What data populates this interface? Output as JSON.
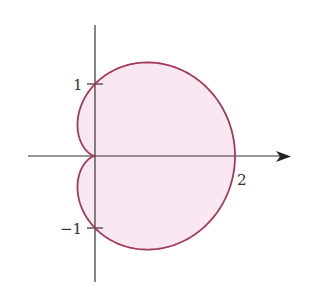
{
  "chart_data": {
    "type": "line",
    "title": "",
    "subtitle": "",
    "xlabel": "",
    "ylabel": "",
    "curve": "r = 1 + cos(theta)",
    "theta_range": [
      0,
      6.283185
    ],
    "series": [
      {
        "name": "cardioid",
        "stroke": "#a33a5a",
        "fill": "#f9e8f1",
        "points": [
          [
            2.0,
            0.0
          ],
          [
            1.866,
            0.5
          ],
          [
            1.5,
            0.866
          ],
          [
            1.0,
            1.0
          ],
          [
            0.75,
            1.299
          ],
          [
            0.0,
            1.0
          ],
          [
            -0.25,
            0.433
          ],
          [
            0.0,
            0.0
          ],
          [
            -0.25,
            -0.433
          ],
          [
            0.0,
            -1.0
          ],
          [
            0.75,
            -1.299
          ],
          [
            1.0,
            -1.0
          ],
          [
            1.5,
            -0.866
          ],
          [
            1.866,
            -0.5
          ],
          [
            2.0,
            0.0
          ]
        ]
      }
    ],
    "x_ticks": [
      {
        "value": 2,
        "label": "2"
      }
    ],
    "y_ticks": [
      {
        "value": 1,
        "label": "1"
      },
      {
        "value": -1,
        "label": "−1"
      }
    ],
    "xlim": [
      -0.95,
      2.8
    ],
    "ylim": [
      -1.75,
      1.8
    ],
    "grid": false,
    "legend": null,
    "axes": {
      "x_arrow": true,
      "y_arrow": false
    }
  },
  "labels": {
    "y_pos": "1",
    "y_neg": "−1",
    "x_pos": "2"
  },
  "colors": {
    "curve": "#a33a5a",
    "fill": "#f9e8f1",
    "axis": "#333333"
  }
}
